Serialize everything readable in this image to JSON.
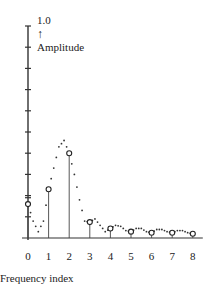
{
  "chart_data": {
    "type": "stem",
    "title": "",
    "xlabel": "Frequency index",
    "ylabel": "Amplitude",
    "y_top_label": "1.0",
    "y_arrow": "↑",
    "ylim": [
      0,
      1.0
    ],
    "xlim": [
      0,
      8
    ],
    "y_ticks": [
      0.1,
      0.2,
      0.3,
      0.4,
      0.5,
      0.6,
      0.7,
      0.8,
      0.9,
      1.0
    ],
    "x_tick_labels": [
      "0",
      "1",
      "2",
      "3",
      "4",
      "5",
      "6",
      "7",
      "8"
    ],
    "grid": false,
    "legend": null,
    "series": [
      {
        "name": "Sampled spectrum",
        "style": "stem with open circles",
        "x": [
          0,
          1,
          2,
          3,
          4,
          5,
          6,
          7,
          8
        ],
        "values": [
          0.16,
          0.23,
          0.4,
          0.075,
          0.045,
          0.03,
          0.025,
          0.025,
          0.02
        ]
      },
      {
        "name": "Continuous spectrum",
        "style": "dotted curve",
        "x": [
          0,
          0.25,
          0.5,
          0.75,
          1.0,
          1.25,
          1.5,
          1.75,
          2.0,
          2.25,
          2.5,
          2.75,
          3.0,
          3.25,
          3.5,
          3.75,
          4.0,
          4.25,
          4.5,
          4.75,
          5.0,
          5.25,
          5.5,
          5.75,
          6.0,
          6.25,
          6.5,
          6.75,
          7.0,
          7.25,
          7.5,
          7.75,
          8.0
        ],
        "values": [
          0.16,
          0.08,
          0.03,
          0.08,
          0.23,
          0.33,
          0.43,
          0.46,
          0.4,
          0.3,
          0.18,
          0.08,
          0.075,
          0.09,
          0.06,
          0.03,
          0.045,
          0.06,
          0.055,
          0.035,
          0.03,
          0.045,
          0.045,
          0.03,
          0.025,
          0.04,
          0.04,
          0.03,
          0.025,
          0.035,
          0.035,
          0.025,
          0.02
        ]
      }
    ]
  }
}
